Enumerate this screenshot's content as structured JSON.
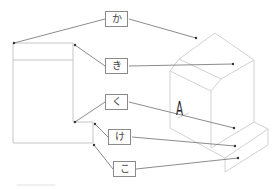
{
  "diagram": {
    "labels": [
      {
        "id": "ka",
        "text": "か"
      },
      {
        "id": "ki",
        "text": "き"
      },
      {
        "id": "ku",
        "text": "く"
      },
      {
        "id": "ke",
        "text": "け"
      },
      {
        "id": "ko",
        "text": "こ"
      }
    ],
    "view_marker": "A",
    "line_color": "#6e6e6e",
    "outline_color": "#c8c8c8"
  }
}
